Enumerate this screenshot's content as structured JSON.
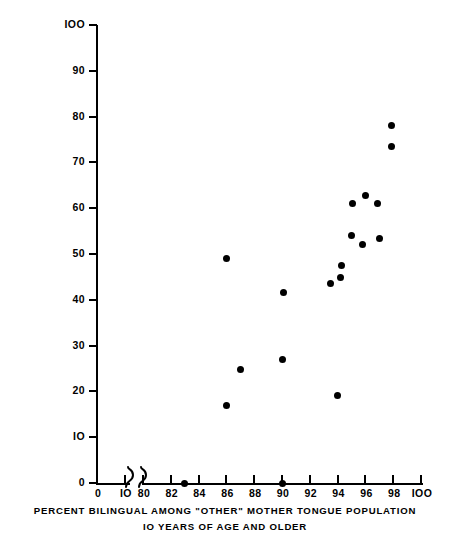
{
  "chart_data": {
    "type": "scatter",
    "title": "",
    "xlabel": "PERCENT BILINGUAL AMONG \"OTHER\" MOTHER TONGUE POPULATION 10 YEARS OF AGE AND OLDER",
    "xlabel_line1": "PERCENT BILINGUAL AMONG \"OTHER\" MOTHER TONGUE POPULATION",
    "xlabel_line2": "IO YEARS OF AGE AND OLDER",
    "ylabel": "CHILDREN OF BILINGUAL \"OTHER\" MOTHER TONGUE PARENTS: PERCENT WITH ENGLISH OR FRENCH MOTHER TONGUE",
    "ylabel_line1": "CHILDREN OF BILINGUAL \"OTHER\" MOTHER TONGUE PARENTS:",
    "ylabel_line2": "PERCENT WITH ENGLISH OR FRENCH MOTHER TONGUE",
    "grid": false,
    "legend": false,
    "axis_break": true,
    "axis_break_note": "x axis broken between 10 and 80",
    "xlim": [
      80,
      100
    ],
    "ylim": [
      0,
      100
    ],
    "xticks": [
      0,
      10,
      80,
      82,
      84,
      86,
      88,
      90,
      92,
      94,
      96,
      98,
      100
    ],
    "xticklabels": [
      "0",
      "IO",
      "80",
      "82",
      "84",
      "86",
      "88",
      "90",
      "92",
      "94",
      "96",
      "98",
      "IOO"
    ],
    "yticks": [
      0,
      10,
      20,
      30,
      40,
      50,
      60,
      70,
      80,
      90,
      100
    ],
    "yticklabels": [
      "0",
      "IO",
      "20",
      "30",
      "40",
      "50",
      "60",
      "70",
      "80",
      "90",
      "IOO"
    ],
    "marker": "filled-circle",
    "marker_color": "#000000",
    "points": [
      {
        "x": 83.0,
        "y": 0.0
      },
      {
        "x": 86.0,
        "y": 17.0
      },
      {
        "x": 86.0,
        "y": 49.0
      },
      {
        "x": 87.0,
        "y": 24.8
      },
      {
        "x": 90.0,
        "y": 0.0
      },
      {
        "x": 90.0,
        "y": 27.0
      },
      {
        "x": 90.1,
        "y": 41.6
      },
      {
        "x": 93.5,
        "y": 43.5
      },
      {
        "x": 94.0,
        "y": 19.0
      },
      {
        "x": 94.2,
        "y": 44.8
      },
      {
        "x": 94.3,
        "y": 47.5
      },
      {
        "x": 95.0,
        "y": 54.0
      },
      {
        "x": 95.1,
        "y": 61.0
      },
      {
        "x": 95.8,
        "y": 52.0
      },
      {
        "x": 96.0,
        "y": 62.8
      },
      {
        "x": 96.9,
        "y": 61.0
      },
      {
        "x": 97.0,
        "y": 53.3
      },
      {
        "x": 97.9,
        "y": 73.5
      },
      {
        "x": 97.9,
        "y": 78.0
      }
    ]
  },
  "axes": {
    "y_tick_0": "0",
    "y_tick_10": "IO",
    "y_tick_20": "20",
    "y_tick_30": "30",
    "y_tick_40": "40",
    "y_tick_50": "50",
    "y_tick_60": "60",
    "y_tick_70": "70",
    "y_tick_80": "80",
    "y_tick_90": "90",
    "y_tick_100": "IOO"
  }
}
